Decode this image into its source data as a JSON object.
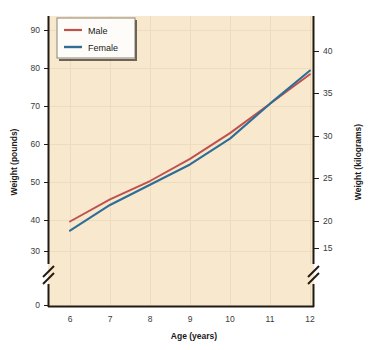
{
  "chart_data": {
    "type": "line",
    "title": "",
    "xlabel": "Age (years)",
    "ylabel": "Weight (pounds)",
    "ylabel_secondary": "Weight (kilograms)",
    "x": [
      6,
      7,
      8,
      9,
      10,
      11,
      12
    ],
    "categories": [
      "6",
      "7",
      "8",
      "9",
      "10",
      "11",
      "12"
    ],
    "series": [
      {
        "name": "Male",
        "color": "#c0504d",
        "values": [
          38,
          44,
          49,
          55,
          62,
          70,
          78
        ]
      },
      {
        "name": "Female",
        "color": "#2e6e96",
        "values": [
          35.5,
          42.5,
          48,
          53.5,
          60.5,
          70,
          79
        ]
      }
    ],
    "xlim": [
      6,
      12
    ],
    "ylim": [
      28,
      93
    ],
    "ylim_secondary": [
      12.7,
      42.2
    ],
    "yticks": [
      "0",
      "30",
      "40",
      "50",
      "60",
      "70",
      "80",
      "90"
    ],
    "yticks_secondary": [
      "15",
      "20",
      "25",
      "30",
      "35",
      "40"
    ],
    "xticks": [
      "6",
      "7",
      "8",
      "9",
      "10",
      "11",
      "12"
    ],
    "axis_break_left": true,
    "axis_break_right": true,
    "grid": true,
    "legend_position": "top-left",
    "plot_background": "#f7e8ce",
    "page_background": "#ffffff",
    "axis_color": "#221a14"
  },
  "legend": {
    "entries": [
      {
        "label": "Male",
        "color": "#c0504d"
      },
      {
        "label": "Female",
        "color": "#2e6e96"
      }
    ]
  },
  "axes": {
    "left": {
      "title": "Weight (pounds)",
      "ticks": [
        {
          "label": "90",
          "y": 30
        },
        {
          "label": "80",
          "y": 68
        },
        {
          "label": "70",
          "y": 106
        },
        {
          "label": "60",
          "y": 144
        },
        {
          "label": "50",
          "y": 182
        },
        {
          "label": "40",
          "y": 220
        },
        {
          "label": "30",
          "y": 251
        },
        {
          "label": "0",
          "y": 305
        }
      ]
    },
    "right": {
      "title": "Weight (kilograms)",
      "ticks": [
        {
          "label": "40",
          "y": 51
        },
        {
          "label": "35",
          "y": 93
        },
        {
          "label": "30",
          "y": 136
        },
        {
          "label": "25",
          "y": 178
        },
        {
          "label": "20",
          "y": 221
        },
        {
          "label": "15",
          "y": 248
        }
      ]
    },
    "bottom": {
      "title": "Age (years)",
      "ticks": [
        {
          "label": "6",
          "x": 70
        },
        {
          "label": "7",
          "x": 110
        },
        {
          "label": "8",
          "x": 150
        },
        {
          "label": "9",
          "x": 190
        },
        {
          "label": "10",
          "x": 230
        },
        {
          "label": "11",
          "x": 270
        },
        {
          "label": "12",
          "x": 310
        }
      ]
    }
  }
}
